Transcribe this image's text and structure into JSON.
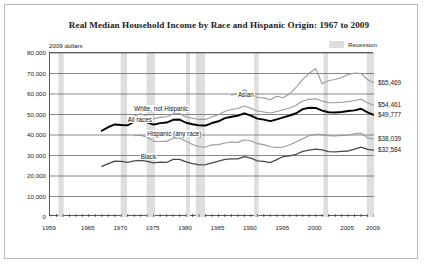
{
  "frame": {
    "border_color": "#b9b9b9"
  },
  "header": {
    "title": "Real Median Household Income by Race and Hispanic Origin: 1967 to 2009",
    "y_axis_note": "2009 dollars"
  },
  "legend": {
    "items": [
      {
        "label": "Recession",
        "color": "#dcdcdc",
        "swatch": "recession-band-swatch"
      }
    ]
  },
  "chart_data": {
    "type": "line",
    "title": "Real Median Household Income by Race and Hispanic Origin: 1967 to 2009",
    "subtitle": "2009 dollars",
    "xlabel": "",
    "ylabel": "2009 dollars",
    "xlim": [
      1959,
      2009
    ],
    "ylim": [
      0,
      80000
    ],
    "grid": true,
    "legend_position": "top-right",
    "ytick_labels": [
      "0",
      "10,000",
      "20,000",
      "30,000",
      "40,000",
      "50,000",
      "60,000",
      "70,000",
      "80,000"
    ],
    "ytick_values": [
      0,
      10000,
      20000,
      30000,
      40000,
      50000,
      60000,
      70000,
      80000
    ],
    "xtick_labels": [
      "1959",
      "1965",
      "1970",
      "1975",
      "1980",
      "1985",
      "1990",
      "1995",
      "2000",
      "2005",
      "2009"
    ],
    "xtick_values": [
      1959,
      1965,
      1970,
      1975,
      1980,
      1985,
      1990,
      1995,
      2000,
      2005,
      2009
    ],
    "end_labels": [
      {
        "series": "Asian",
        "value": 65469,
        "text": "$65,469"
      },
      {
        "series": "White, not Hispanic",
        "value": 54461,
        "text": "$54,461"
      },
      {
        "series": "All races",
        "value": 49777,
        "text": "$49,777"
      },
      {
        "series": "Hispanic (any race)",
        "value": 38039,
        "text": "$38,039"
      },
      {
        "series": "Black",
        "value": 32584,
        "text": "$32,584"
      }
    ],
    "annotations": [
      {
        "text": "Asian",
        "x": 1988,
        "y": 59000
      },
      {
        "text": "White, not Hispanic",
        "x": 1972,
        "y": 52200
      },
      {
        "text": "All races",
        "x": 1971,
        "y": 46600
      },
      {
        "text": "Hispanic (any race)",
        "x": 1974,
        "y": 40000
      },
      {
        "text": "Black",
        "x": 1973,
        "y": 28700
      }
    ],
    "recessions": [
      {
        "start": 1960.3,
        "end": 1961.1
      },
      {
        "start": 1969.9,
        "end": 1970.9
      },
      {
        "start": 1973.9,
        "end": 1975.2
      },
      {
        "start": 1980.0,
        "end": 1980.6
      },
      {
        "start": 1981.5,
        "end": 1982.9
      },
      {
        "start": 1990.5,
        "end": 1991.2
      },
      {
        "start": 2001.2,
        "end": 2001.9
      },
      {
        "start": 2007.9,
        "end": 2009.4
      }
    ],
    "series": [
      {
        "name": "All races",
        "color": "#000000",
        "width": 1.9,
        "x": [
          1967,
          1968,
          1969,
          1970,
          1971,
          1972,
          1973,
          1974,
          1975,
          1976,
          1977,
          1978,
          1979,
          1980,
          1981,
          1982,
          1983,
          1984,
          1985,
          1986,
          1987,
          1988,
          1989,
          1990,
          1991,
          1992,
          1993,
          1994,
          1995,
          1996,
          1997,
          1998,
          1999,
          2000,
          2001,
          2002,
          2003,
          2004,
          2005,
          2006,
          2007,
          2008,
          2009
        ],
        "values": [
          42056,
          43868,
          45146,
          44886,
          44752,
          46473,
          47530,
          46160,
          45074,
          45769,
          46063,
          47405,
          47527,
          45984,
          45260,
          44680,
          44600,
          45850,
          46700,
          48200,
          48900,
          49400,
          50600,
          49400,
          48000,
          47500,
          46800,
          47600,
          48600,
          49500,
          50600,
          52600,
          53300,
          53200,
          51900,
          51100,
          51000,
          51200,
          51700,
          52000,
          52800,
          51000,
          49777
        ]
      },
      {
        "name": "White, not Hispanic",
        "color": "#9a9a9a",
        "width": 1.1,
        "x": [
          1972,
          1973,
          1974,
          1975,
          1976,
          1977,
          1978,
          1979,
          1980,
          1981,
          1982,
          1983,
          1984,
          1985,
          1986,
          1987,
          1988,
          1989,
          1990,
          1991,
          1992,
          1993,
          1994,
          1995,
          1996,
          1997,
          1998,
          1999,
          2000,
          2001,
          2002,
          2003,
          2004,
          2005,
          2006,
          2007,
          2008,
          2009
        ],
        "values": [
          49300,
          50400,
          49100,
          47900,
          48600,
          48900,
          50300,
          50500,
          48800,
          48200,
          47600,
          47600,
          48900,
          49900,
          51600,
          52400,
          52900,
          54100,
          53100,
          51700,
          51200,
          50700,
          51500,
          52300,
          53200,
          54500,
          56600,
          57400,
          57700,
          56600,
          55800,
          55700,
          56000,
          56300,
          56800,
          57400,
          55700,
          54461
        ]
      },
      {
        "name": "Asian",
        "color": "#9a9a9a",
        "width": 1.1,
        "x": [
          1987,
          1988,
          1989,
          1990,
          1991,
          1992,
          1993,
          1994,
          1995,
          1996,
          1997,
          1998,
          1999,
          2000,
          2001,
          2002,
          2003,
          2004,
          2005,
          2006,
          2007,
          2008,
          2009
        ],
        "values": [
          59400,
          60200,
          62100,
          60400,
          58300,
          58100,
          57200,
          58900,
          58200,
          60100,
          63300,
          67100,
          70100,
          72300,
          65000,
          66600,
          67100,
          68100,
          69500,
          70200,
          70000,
          67000,
          65469
        ]
      },
      {
        "name": "Hispanic (any race)",
        "color": "#9a9a9a",
        "width": 1.1,
        "x": [
          1972,
          1973,
          1974,
          1975,
          1976,
          1977,
          1978,
          1979,
          1980,
          1981,
          1982,
          1983,
          1984,
          1985,
          1986,
          1987,
          1988,
          1989,
          1990,
          1991,
          1992,
          1993,
          1994,
          1995,
          1996,
          1997,
          1998,
          1999,
          2000,
          2001,
          2002,
          2003,
          2004,
          2005,
          2006,
          2007,
          2008,
          2009
        ],
        "values": [
          39600,
          39900,
          38900,
          36900,
          36800,
          37000,
          38400,
          38500,
          36900,
          35400,
          34300,
          34100,
          35200,
          35300,
          36100,
          36600,
          36400,
          37700,
          37100,
          35800,
          35300,
          34300,
          33900,
          34100,
          35200,
          36600,
          38200,
          39600,
          40400,
          40200,
          39700,
          39500,
          39800,
          39900,
          40600,
          41000,
          38600,
          38039
        ]
      },
      {
        "name": "Black",
        "color": "#4a4a4a",
        "width": 1.3,
        "x": [
          1967,
          1968,
          1969,
          1970,
          1971,
          1972,
          1973,
          1974,
          1975,
          1976,
          1977,
          1978,
          1979,
          1980,
          1981,
          1982,
          1983,
          1984,
          1985,
          1986,
          1987,
          1988,
          1989,
          1990,
          1991,
          1992,
          1993,
          1994,
          1995,
          1996,
          1997,
          1998,
          1999,
          2000,
          2001,
          2002,
          2003,
          2004,
          2005,
          2006,
          2007,
          2008,
          2009
        ],
        "values": [
          24700,
          26000,
          27300,
          27100,
          26700,
          27400,
          27600,
          27100,
          26400,
          26800,
          26600,
          28100,
          28100,
          26900,
          26000,
          25400,
          25500,
          26400,
          27200,
          28100,
          28400,
          28400,
          29500,
          28700,
          27400,
          27100,
          26500,
          28000,
          29500,
          29800,
          30600,
          32000,
          32600,
          33100,
          32700,
          31900,
          31800,
          32000,
          32200,
          33100,
          34100,
          33000,
          32584
        ]
      }
    ]
  }
}
